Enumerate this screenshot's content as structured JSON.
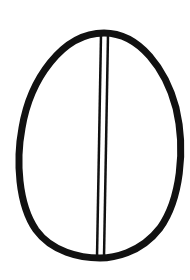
{
  "image": {
    "description": "Line drawing of an egg-shaped oval divided vertically by a double line",
    "stroke_color": "#111111",
    "background_color": "#ffffff",
    "shapes": {
      "oval": {
        "cx": 101,
        "cy": 147,
        "rx": 80,
        "ry": 111,
        "stroke_width": 7
      },
      "divider": {
        "line_a": {
          "x1": 101,
          "y1": 35,
          "x2": 97,
          "y2": 257,
          "stroke_width": 2.5
        },
        "line_b": {
          "x1": 108,
          "y1": 35,
          "x2": 104,
          "y2": 257,
          "stroke_width": 2.5
        }
      }
    }
  }
}
